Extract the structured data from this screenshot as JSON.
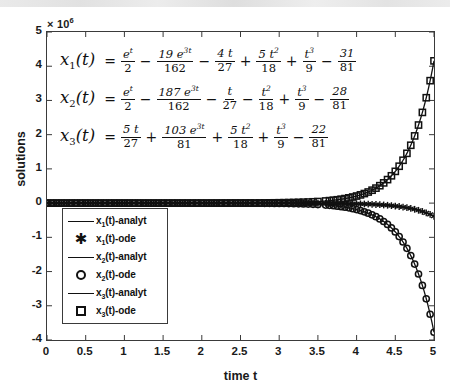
{
  "chart_data": {
    "type": "line",
    "title": "",
    "xlabel": "time t",
    "ylabel": "solutions",
    "y_multiplier_text": "× 10",
    "y_multiplier_exp": "6",
    "y_multiplier_value": 1000000,
    "xlim": [
      0,
      5
    ],
    "ylim": [
      -4,
      5
    ],
    "xticks": [
      "0",
      "0.5",
      "1",
      "1.5",
      "2",
      "2.5",
      "3",
      "3.5",
      "4",
      "4.5",
      "5"
    ],
    "xtick_values": [
      0,
      0.5,
      1,
      1.5,
      2,
      2.5,
      3,
      3.5,
      4,
      4.5,
      5
    ],
    "yticks": [
      "5",
      "4",
      "3",
      "2",
      "1",
      "0",
      "-1",
      "-2",
      "-3",
      "-4"
    ],
    "ytick_values": [
      5,
      4,
      3,
      2,
      1,
      0,
      -1,
      -2,
      -3,
      -4
    ],
    "grid": false,
    "legend_position": "lower-left",
    "x": [
      0,
      0.25,
      0.5,
      0.75,
      1,
      1.25,
      1.5,
      1.75,
      2,
      2.25,
      2.5,
      2.75,
      3,
      3.25,
      3.5,
      3.6,
      3.7,
      3.8,
      3.9,
      4,
      4.1,
      4.2,
      4.3,
      4.4,
      4.5,
      4.6,
      4.7,
      4.8,
      4.9,
      5
    ],
    "series": [
      {
        "name": "x_1(t)-analyt",
        "label_plain": "x1(t)-analyt",
        "style": "line",
        "marker": "none",
        "color": "#111111",
        "values": [
          -3.83e-07,
          -5.8e-07,
          -1.07e-06,
          -2.25e-06,
          -5e-06,
          -1.13e-05,
          -2.58e-05,
          -5.9e-05,
          -0.000135,
          -0.000308,
          -0.000705,
          -0.001612,
          -0.00369,
          -0.00843,
          -0.01929,
          -0.02604,
          -0.03515,
          -0.04744,
          -0.06404,
          -0.08646,
          -0.11672,
          -0.15758,
          -0.21275,
          -0.28724,
          -0.38782,
          -0.52362,
          -0.70697,
          -0.95456,
          -1.28884,
          -1.74015
        ]
      },
      {
        "name": "x_1(t)-ode",
        "label_plain": "x1(t)-ode",
        "style": "marker",
        "marker": "asterisk",
        "color": "#111111",
        "values": [
          -3.83e-07,
          -5.8e-07,
          -1.07e-06,
          -2.25e-06,
          -5e-06,
          -1.13e-05,
          -2.58e-05,
          -5.9e-05,
          -0.000135,
          -0.000308,
          -0.000705,
          -0.001612,
          -0.00369,
          -0.00843,
          -0.01929,
          -0.02604,
          -0.03515,
          -0.04744,
          -0.06404,
          -0.08646,
          -0.11672,
          -0.15758,
          -0.21275,
          -0.28724,
          -0.38782,
          -0.52362,
          -0.70697,
          -0.95456,
          -1.28884,
          -1.74015
        ]
      },
      {
        "name": "x_2(t)-analyt",
        "label_plain": "x2(t)-analyt",
        "style": "line",
        "marker": "none",
        "color": "#111111",
        "values": [
          -1.15e-06,
          -2.45e-06,
          -5.2e-06,
          -1.1e-05,
          -2.35e-05,
          -5e-05,
          -0.000107,
          -0.000228,
          -0.000487,
          -0.00104,
          -0.002222,
          -0.004748,
          -0.010146,
          -0.021682,
          -0.046337,
          -0.062545,
          -0.084427,
          -0.113965,
          -0.153837,
          -0.207664,
          -0.280327,
          -0.378421,
          -0.510871,
          -0.689649,
          -0.930997,
          -1.256782,
          -1.696658,
          -2.290426,
          -3.09206,
          -4.17417
        ]
      },
      {
        "name": "x_2(t)-ode",
        "label_plain": "x2(t)-ode",
        "style": "marker",
        "marker": "circle",
        "color": "#111111",
        "values": [
          -1.15e-06,
          -2.45e-06,
          -5.2e-06,
          -1.1e-05,
          -2.35e-05,
          -5e-05,
          -0.000107,
          -0.000228,
          -0.000487,
          -0.00104,
          -0.002222,
          -0.004748,
          -0.010146,
          -0.021682,
          -0.046337,
          -0.062545,
          -0.084427,
          -0.113965,
          -0.153837,
          -0.207664,
          -0.280327,
          -0.378421,
          -0.510871,
          -0.689649,
          -0.930997,
          -1.256782,
          -1.696658,
          -2.290426,
          -3.09206,
          -4.17417
        ]
      },
      {
        "name": "x_3(t)-analyt",
        "label_plain": "x3(t)-analyt",
        "style": "line",
        "marker": "none",
        "color": "#111111",
        "values": [
          1.27e-06,
          2.7e-06,
          5.7e-06,
          1.21e-05,
          2.58e-05,
          5.5e-05,
          0.000118,
          0.000251,
          0.000537,
          0.001146,
          0.002448,
          0.005231,
          0.011178,
          0.023885,
          0.051045,
          0.068906,
          0.093012,
          0.125552,
          0.169473,
          0.228762,
          0.308815,
          0.416886,
          0.562767,
          0.759706,
          1.02553,
          1.384373,
          1.868847,
          2.522939,
          3.406076,
          4.598144
        ]
      },
      {
        "name": "x_3(t)-ode",
        "label_plain": "x3(t)-ode",
        "style": "marker",
        "marker": "square",
        "color": "#111111",
        "values": [
          1.27e-06,
          2.7e-06,
          5.7e-06,
          1.21e-05,
          2.58e-05,
          5.5e-05,
          0.000118,
          0.000251,
          0.000537,
          0.001146,
          0.002448,
          0.005231,
          0.011178,
          0.023885,
          0.051045,
          0.068906,
          0.093012,
          0.125552,
          0.169473,
          0.228762,
          0.308815,
          0.416886,
          0.562767,
          0.759706,
          1.02553,
          1.384373,
          1.868847,
          2.522939,
          3.406076,
          4.598144
        ]
      }
    ],
    "annotations": {
      "equation_1": "x1(t) = e^t/2 - 19 e^(3t)/162 - 4t/27 + 5t^2/18 + t^3/9 - 31/81",
      "equation_2": "x2(t) = e^t/2 - 187 e^(3t)/162 - t/27 - t^2/18 + t^3/9 - 28/81",
      "equation_3": "x3(t) = 5t/27 + 103 e^(3t)/81 + 5t^2/18 + t^3/9 - 22/81"
    }
  },
  "axis": {
    "y_multiplier_base": "× 10",
    "y_multiplier_exp": "6",
    "ylabel": "solutions",
    "xlabel": "time t"
  },
  "equations": [
    {
      "id": "eq1",
      "lhs": "x",
      "lhs_sub": "1",
      "lhs_arg": "(t)",
      "eq": "=",
      "terms": [
        {
          "op": "",
          "num": "e",
          "num_sup": "t",
          "den": "2"
        },
        {
          "op": "−",
          "num": "19 e",
          "num_sup": "3t",
          "den": "162"
        },
        {
          "op": "−",
          "num": "4 t",
          "num_sup": "",
          "den": "27"
        },
        {
          "op": "+",
          "num": "5 t",
          "num_sup": "2",
          "den": "18"
        },
        {
          "op": "+",
          "num": "t",
          "num_sup": "3",
          "den": "9"
        },
        {
          "op": "−",
          "num": "31",
          "num_sup": "",
          "den": "81"
        }
      ]
    },
    {
      "id": "eq2",
      "lhs": "x",
      "lhs_sub": "2",
      "lhs_arg": "(t)",
      "eq": "=",
      "terms": [
        {
          "op": "",
          "num": "e",
          "num_sup": "t",
          "den": "2"
        },
        {
          "op": "−",
          "num": "187 e",
          "num_sup": "3t",
          "den": "162"
        },
        {
          "op": "−",
          "num": "t",
          "num_sup": "",
          "den": "27"
        },
        {
          "op": "−",
          "num": "t",
          "num_sup": "2",
          "den": "18"
        },
        {
          "op": "+",
          "num": "t",
          "num_sup": "3",
          "den": "9"
        },
        {
          "op": "−",
          "num": "28",
          "num_sup": "",
          "den": "81"
        }
      ]
    },
    {
      "id": "eq3",
      "lhs": "x",
      "lhs_sub": "3",
      "lhs_arg": "(t)",
      "eq": "=",
      "terms": [
        {
          "op": "",
          "num": "5 t",
          "num_sup": "",
          "den": "27"
        },
        {
          "op": "+",
          "num": "103 e",
          "num_sup": "3t",
          "den": "81"
        },
        {
          "op": "+",
          "num": "5 t",
          "num_sup": "2",
          "den": "18"
        },
        {
          "op": "+",
          "num": "t",
          "num_sup": "3",
          "den": "9"
        },
        {
          "op": "−",
          "num": "22",
          "num_sup": "",
          "den": "81"
        }
      ]
    }
  ],
  "legend": {
    "items": [
      {
        "symbol": "line",
        "name": "x",
        "sub": "1",
        "suffix": "(t)-analyt"
      },
      {
        "symbol": "asterisk",
        "name": "x",
        "sub": "1",
        "suffix": "(t)-ode"
      },
      {
        "symbol": "line",
        "name": "x",
        "sub": "2",
        "suffix": "(t)-analyt"
      },
      {
        "symbol": "circle",
        "name": "x",
        "sub": "2",
        "suffix": "(t)-ode"
      },
      {
        "symbol": "line",
        "name": "x",
        "sub": "3",
        "suffix": "(t)-analyt"
      },
      {
        "symbol": "square",
        "name": "x",
        "sub": "3",
        "suffix": "(t)-ode"
      }
    ]
  }
}
